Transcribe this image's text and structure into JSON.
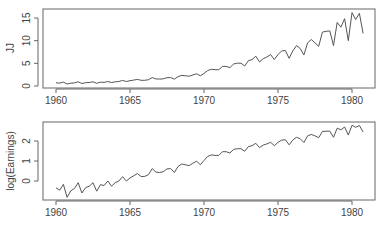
{
  "chart_data": [
    {
      "type": "line",
      "title": "",
      "xlabel": "",
      "ylabel": "JJ",
      "xlim": [
        1959.4,
        1981.5
      ],
      "ylim": [
        0,
        17
      ],
      "xticks": [
        1960,
        1965,
        1970,
        1975,
        1980
      ],
      "yticks": [
        0,
        5,
        10,
        15
      ],
      "grid": false,
      "x_start": 1960,
      "x_step": 0.25,
      "values": [
        0.71,
        0.63,
        0.85,
        0.44,
        0.61,
        0.69,
        0.92,
        0.55,
        0.72,
        0.77,
        0.92,
        0.6,
        0.83,
        0.8,
        1.0,
        0.77,
        0.92,
        1.0,
        1.24,
        1.0,
        1.16,
        1.3,
        1.45,
        1.25,
        1.26,
        1.38,
        1.86,
        1.56,
        1.53,
        1.59,
        1.83,
        1.86,
        1.53,
        2.07,
        2.34,
        2.25,
        2.16,
        2.43,
        2.7,
        2.25,
        2.79,
        3.42,
        3.69,
        3.6,
        3.6,
        4.32,
        4.32,
        4.05,
        4.86,
        5.04,
        5.04,
        4.41,
        5.58,
        5.85,
        6.57,
        5.31,
        6.03,
        6.39,
        6.93,
        5.85,
        6.93,
        7.74,
        7.83,
        6.12,
        7.74,
        8.91,
        8.28,
        6.84,
        9.54,
        10.26,
        9.54,
        8.73,
        11.88,
        12.06,
        12.15,
        8.91,
        14.04,
        12.96,
        14.85,
        9.99,
        16.2,
        14.67,
        16.02,
        11.61
      ]
    },
    {
      "type": "line",
      "title": "",
      "xlabel": "",
      "ylabel": "log(Earnings)",
      "xlim": [
        1959.4,
        1981.5
      ],
      "ylim": [
        -0.95,
        2.9
      ],
      "xticks": [
        1960,
        1965,
        1970,
        1975,
        1980
      ],
      "yticks": [
        0,
        1,
        2
      ],
      "grid": false,
      "x_start": 1960,
      "x_step": 0.25,
      "derived_from": "log of JJ series"
    }
  ],
  "panels": {
    "top": {
      "ylabel": "JJ",
      "ytick_labels": [
        "0",
        "5",
        "10",
        "15"
      ],
      "xtick_labels": [
        "1960",
        "1965",
        "1970",
        "1975",
        "1980"
      ]
    },
    "bottom": {
      "ylabel": "log(Earnings)",
      "ytick_labels": [
        "0",
        "1",
        "2"
      ],
      "xtick_labels": [
        "1960",
        "1965",
        "1970",
        "1975",
        "1980"
      ]
    }
  },
  "colors": {
    "line": "#555555",
    "axis": "#555555",
    "text": "#444444"
  }
}
